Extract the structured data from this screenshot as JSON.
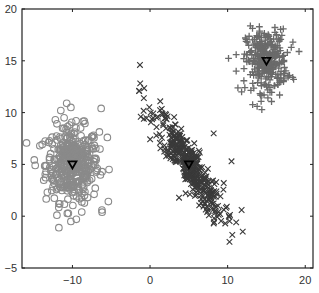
{
  "chart_data": {
    "type": "scatter",
    "title": "",
    "xlabel": "",
    "ylabel": "",
    "xlim": [
      -16.5,
      21
    ],
    "ylim": [
      -5,
      20
    ],
    "grid": false,
    "legend": null,
    "x_ticks": [
      -10,
      0,
      10,
      20
    ],
    "x_tick_labels": [
      "−10",
      "0",
      "10",
      "20"
    ],
    "y_ticks": [
      -5,
      0,
      5,
      10,
      15,
      20
    ],
    "y_tick_labels": [
      "−5",
      "0",
      "5",
      "10",
      "15",
      "20"
    ],
    "series": [
      {
        "name": "cluster-1",
        "marker": "circle",
        "color": "#8a8a8a",
        "count": 400,
        "center": [
          -10,
          5
        ],
        "std": [
          1.7,
          1.8
        ],
        "correlation": 0,
        "centroid": [
          -10,
          5
        ],
        "outliers": [
          [
            -11.5,
            10.2
          ],
          [
            -10.2,
            10.5
          ],
          [
            -6.3,
            10.4
          ],
          [
            -12.2,
            9.3
          ],
          [
            -12.0,
            0.1
          ],
          [
            -10.2,
            -0.5
          ],
          [
            -9.5,
            -0.3
          ],
          [
            -8.8,
            0.4
          ],
          [
            -6.2,
            0.6
          ],
          [
            -5.5,
            7.6
          ],
          [
            -14.8,
            4.9
          ],
          [
            -14.2,
            6.8
          ]
        ]
      },
      {
        "name": "cluster-2",
        "marker": "x",
        "color": "#3a3a3a",
        "count": 400,
        "center": [
          5,
          5
        ],
        "std": [
          2.2,
          2.6
        ],
        "correlation": -0.9,
        "centroid": [
          5,
          5
        ],
        "outliers": [
          [
            -1.3,
            14.6
          ],
          [
            -1.4,
            12.1
          ],
          [
            -0.8,
            11.4
          ],
          [
            -1.2,
            9.6
          ],
          [
            -0.8,
            9.4
          ],
          [
            8.2,
            8.0
          ],
          [
            10.5,
            5.3
          ],
          [
            9.5,
            3.2
          ],
          [
            11.8,
            0.6
          ],
          [
            11.1,
            -0.6
          ],
          [
            10.6,
            -1.8
          ],
          [
            8.2,
            -0.7
          ]
        ]
      },
      {
        "name": "cluster-3",
        "marker": "plus",
        "color": "#6a6a6a",
        "count": 300,
        "center": [
          15,
          15
        ],
        "std": [
          1.3,
          1.5
        ],
        "correlation": 0,
        "centroid": [
          15,
          15
        ],
        "outliers": [
          [
            13.8,
            10.6
          ],
          [
            18.2,
            16.3
          ],
          [
            17.7,
            15.8
          ],
          [
            19.2,
            15.9
          ],
          [
            11.1,
            14.0
          ],
          [
            11.8,
            12.0
          ],
          [
            17.2,
            13.0
          ],
          [
            18.5,
            13.2
          ],
          [
            16.7,
            11.7
          ]
        ]
      }
    ],
    "centroid_marker": "triangle-down",
    "centroid_color": "#000000"
  },
  "colors": {
    "axis": "#222222",
    "background": "#ffffff"
  }
}
